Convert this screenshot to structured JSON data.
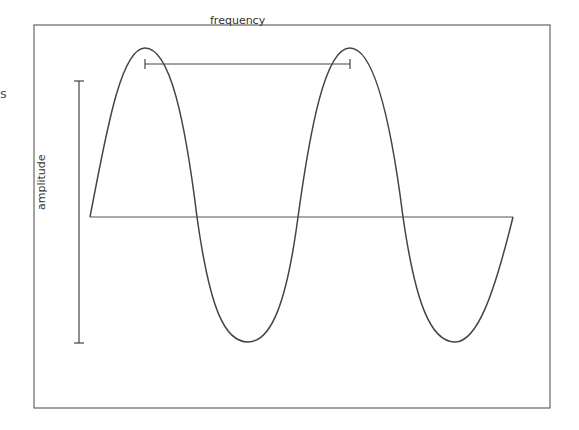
{
  "diagram": {
    "labels": {
      "frequency": "frequency",
      "amplitude": "amplitude",
      "stray_mark": "s"
    },
    "colors": {
      "line": "#444444",
      "frame": "#666666",
      "background": "#ffffff"
    },
    "wave": {
      "start_x": 90,
      "end_x": 513,
      "baseline_y": 217,
      "peak_y": 48,
      "trough_y": 342,
      "peaks_x": [
        145,
        350
      ],
      "troughs_x": [
        248,
        455
      ]
    }
  }
}
